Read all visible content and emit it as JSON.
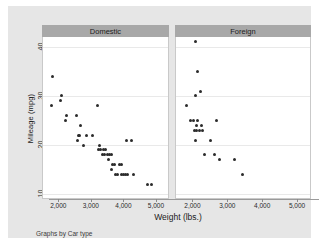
{
  "chart_data": {
    "type": "scatter",
    "title": "",
    "xlabel": "Weight (lbs.)",
    "ylabel": "Mileage (mpg)",
    "caption": "Graphs by Car type",
    "xlim": [
      1500,
      5400
    ],
    "ylim": [
      9,
      42
    ],
    "xticks": [
      2000,
      3000,
      4000,
      5000
    ],
    "xticklabels": [
      "2,000",
      "3,000",
      "4,000",
      "5,000"
    ],
    "yticks": [
      10,
      20,
      30,
      40
    ],
    "yticklabels": [
      "10",
      "20",
      "30",
      "40"
    ],
    "grid": "horizontal",
    "legend": "none",
    "facet_by": "Car type",
    "marker_color": "#2b2b2b",
    "panel_header_color": "#a8a8a8",
    "background_color": "#e6e6e6",
    "plot_background_color": "#ffffff",
    "panels": [
      {
        "label": "Domestic",
        "points": [
          {
            "x": 1800,
            "y": 34
          },
          {
            "x": 1760,
            "y": 28
          },
          {
            "x": 2070,
            "y": 30
          },
          {
            "x": 2050,
            "y": 29
          },
          {
            "x": 2230,
            "y": 26
          },
          {
            "x": 2200,
            "y": 25
          },
          {
            "x": 2520,
            "y": 26
          },
          {
            "x": 2650,
            "y": 24
          },
          {
            "x": 2580,
            "y": 22
          },
          {
            "x": 2630,
            "y": 22
          },
          {
            "x": 2560,
            "y": 21
          },
          {
            "x": 2830,
            "y": 22
          },
          {
            "x": 2750,
            "y": 20
          },
          {
            "x": 3180,
            "y": 28
          },
          {
            "x": 3030,
            "y": 22
          },
          {
            "x": 3250,
            "y": 20
          },
          {
            "x": 3200,
            "y": 19
          },
          {
            "x": 3280,
            "y": 19
          },
          {
            "x": 3350,
            "y": 19
          },
          {
            "x": 3420,
            "y": 19
          },
          {
            "x": 3330,
            "y": 18
          },
          {
            "x": 3400,
            "y": 18
          },
          {
            "x": 3470,
            "y": 18
          },
          {
            "x": 3540,
            "y": 18
          },
          {
            "x": 3610,
            "y": 18
          },
          {
            "x": 3500,
            "y": 17
          },
          {
            "x": 3620,
            "y": 16
          },
          {
            "x": 3700,
            "y": 16
          },
          {
            "x": 3850,
            "y": 16
          },
          {
            "x": 3900,
            "y": 16
          },
          {
            "x": 3600,
            "y": 15
          },
          {
            "x": 3720,
            "y": 14
          },
          {
            "x": 3790,
            "y": 14
          },
          {
            "x": 3900,
            "y": 14
          },
          {
            "x": 3970,
            "y": 14
          },
          {
            "x": 4030,
            "y": 14
          },
          {
            "x": 4100,
            "y": 14
          },
          {
            "x": 4290,
            "y": 14
          },
          {
            "x": 4060,
            "y": 21
          },
          {
            "x": 4230,
            "y": 21
          },
          {
            "x": 4720,
            "y": 12
          },
          {
            "x": 4840,
            "y": 12
          }
        ]
      },
      {
        "label": "Foreign",
        "points": [
          {
            "x": 2070,
            "y": 41
          },
          {
            "x": 2120,
            "y": 35
          },
          {
            "x": 2200,
            "y": 31
          },
          {
            "x": 2050,
            "y": 30
          },
          {
            "x": 1800,
            "y": 28
          },
          {
            "x": 1930,
            "y": 25
          },
          {
            "x": 1990,
            "y": 25
          },
          {
            "x": 2120,
            "y": 25
          },
          {
            "x": 2650,
            "y": 25
          },
          {
            "x": 2100,
            "y": 24
          },
          {
            "x": 2240,
            "y": 24
          },
          {
            "x": 2020,
            "y": 23
          },
          {
            "x": 2090,
            "y": 23
          },
          {
            "x": 2160,
            "y": 23
          },
          {
            "x": 2260,
            "y": 23
          },
          {
            "x": 2050,
            "y": 21
          },
          {
            "x": 2500,
            "y": 21
          },
          {
            "x": 2320,
            "y": 18
          },
          {
            "x": 2600,
            "y": 18
          },
          {
            "x": 2750,
            "y": 17
          },
          {
            "x": 3170,
            "y": 17
          },
          {
            "x": 3420,
            "y": 14
          }
        ]
      }
    ]
  }
}
